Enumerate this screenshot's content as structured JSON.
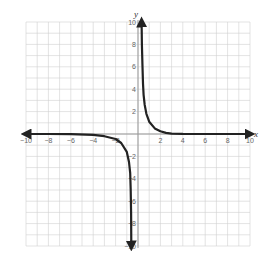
{
  "chart_data": {
    "type": "line",
    "title": "",
    "xlabel": "x",
    "ylabel": "y",
    "xlim": [
      -10,
      10
    ],
    "ylim": [
      -10,
      10
    ],
    "grid": true,
    "grid_step": 1,
    "x_tick_labels": [
      "-10",
      "-8",
      "-6",
      "-4",
      "-2",
      "2",
      "4",
      "6",
      "8",
      "10"
    ],
    "y_tick_labels": [
      "10",
      "8",
      "6",
      "4",
      "2",
      "-2",
      "-4",
      "-6",
      "-8",
      "-10"
    ],
    "series": [
      {
        "name": "right-branch",
        "points": [
          [
            0.32,
            10
          ],
          [
            0.35,
            8
          ],
          [
            0.4,
            6
          ],
          [
            0.45,
            4.5
          ],
          [
            0.5,
            3.5
          ],
          [
            0.6,
            2.6
          ],
          [
            0.75,
            1.8
          ],
          [
            1,
            1.1
          ],
          [
            1.5,
            0.5
          ],
          [
            2,
            0.25
          ],
          [
            2.5,
            0.1
          ],
          [
            3,
            0.04
          ],
          [
            4,
            0.01
          ],
          [
            6,
            0
          ],
          [
            8,
            0
          ],
          [
            10,
            0
          ]
        ],
        "arrow_ends": true
      },
      {
        "name": "left-branch",
        "points": [
          [
            -10,
            0
          ],
          [
            -8,
            0
          ],
          [
            -6,
            -0.02
          ],
          [
            -4,
            -0.08
          ],
          [
            -3,
            -0.2
          ],
          [
            -2,
            -0.45
          ],
          [
            -1.5,
            -0.8
          ],
          [
            -1,
            -1.6
          ],
          [
            -0.8,
            -2.5
          ],
          [
            -0.7,
            -3.5
          ],
          [
            -0.65,
            -5
          ],
          [
            -0.62,
            -7
          ],
          [
            -0.6,
            -10
          ]
        ],
        "arrow_ends": true
      }
    ]
  },
  "axes": {
    "x_label": "x",
    "y_label": "y"
  },
  "colors": {
    "curve": "#222222",
    "grid": "#d0d0d0",
    "axis": "#999999"
  }
}
